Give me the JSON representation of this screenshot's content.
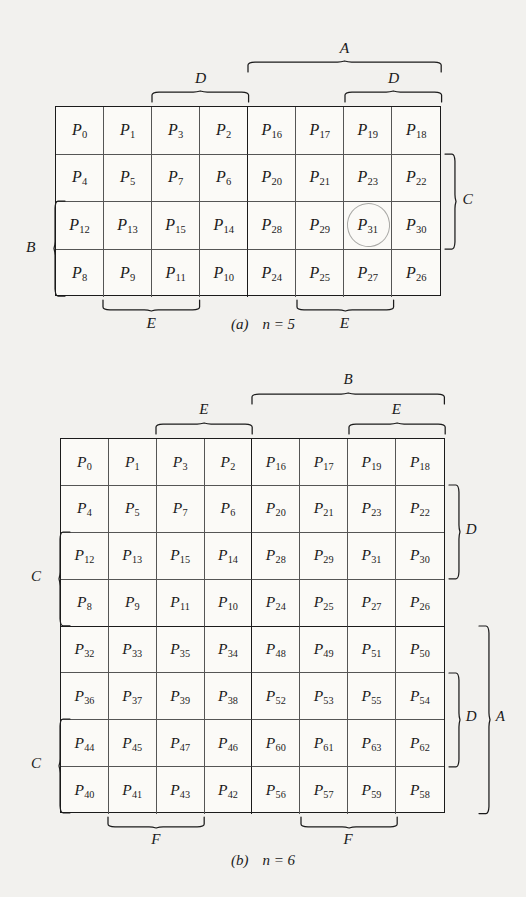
{
  "page": {
    "background_color": "#f2f1ee",
    "ink_color": "#1b1b1b",
    "pencil_color": "#9a9a96"
  },
  "figures": [
    {
      "id": "figure-a",
      "caption_label": "(a)",
      "caption_text": "n = 5",
      "rows": 4,
      "cols": 8,
      "cells": [
        [
          "P0",
          "P1",
          "P3",
          "P2",
          "P16",
          "P17",
          "P19",
          "P18"
        ],
        [
          "P4",
          "P5",
          "P7",
          "P6",
          "P20",
          "P21",
          "P23",
          "P22"
        ],
        [
          "P12",
          "P13",
          "P15",
          "P14",
          "P28",
          "P29",
          "P31",
          "P30"
        ],
        [
          "P8",
          "P9",
          "P11",
          "P10",
          "P24",
          "P25",
          "P27",
          "P26"
        ]
      ],
      "cell_subscripts": [
        [
          "0",
          "1",
          "3",
          "2",
          "16",
          "17",
          "19",
          "18"
        ],
        [
          "4",
          "5",
          "7",
          "6",
          "20",
          "21",
          "23",
          "22"
        ],
        [
          "12",
          "13",
          "15",
          "14",
          "28",
          "29",
          "31",
          "30"
        ],
        [
          "8",
          "9",
          "11",
          "10",
          "24",
          "25",
          "27",
          "26"
        ]
      ],
      "cell_base": "P",
      "circled_cell": {
        "row": 2,
        "col": 6,
        "label": "P31"
      },
      "braces": [
        {
          "label": "A",
          "side": "top",
          "from_col": 4,
          "to_col": 7,
          "level": 2
        },
        {
          "label": "D",
          "side": "top",
          "from_col": 2,
          "to_col": 3,
          "level": 1
        },
        {
          "label": "D",
          "side": "top",
          "from_col": 6,
          "to_col": 7,
          "level": 1
        },
        {
          "label": "E",
          "side": "bottom",
          "from_col": 1,
          "to_col": 2,
          "level": 1
        },
        {
          "label": "E",
          "side": "bottom",
          "from_col": 5,
          "to_col": 6,
          "level": 1
        },
        {
          "label": "B",
          "side": "left",
          "from_row": 2,
          "to_row": 3,
          "level": 1
        },
        {
          "label": "C",
          "side": "right",
          "from_row": 1,
          "to_row": 2,
          "level": 1
        }
      ]
    },
    {
      "id": "figure-b",
      "caption_label": "(b)",
      "caption_text": "n = 6",
      "rows": 8,
      "cols": 8,
      "cells": [
        [
          "P0",
          "P1",
          "P3",
          "P2",
          "P16",
          "P17",
          "P19",
          "P18"
        ],
        [
          "P4",
          "P5",
          "P7",
          "P6",
          "P20",
          "P21",
          "P23",
          "P22"
        ],
        [
          "P12",
          "P13",
          "P15",
          "P14",
          "P28",
          "P29",
          "P31",
          "P30"
        ],
        [
          "P8",
          "P9",
          "P11",
          "P10",
          "P24",
          "P25",
          "P27",
          "P26"
        ],
        [
          "P32",
          "P33",
          "P35",
          "P34",
          "P48",
          "P49",
          "P51",
          "P50"
        ],
        [
          "P36",
          "P37",
          "P39",
          "P38",
          "P52",
          "P53",
          "P55",
          "P54"
        ],
        [
          "P44",
          "P45",
          "P47",
          "P46",
          "P60",
          "P61",
          "P63",
          "P62"
        ],
        [
          "P40",
          "P41",
          "P43",
          "P42",
          "P56",
          "P57",
          "P59",
          "P58"
        ]
      ],
      "cell_subscripts": [
        [
          "0",
          "1",
          "3",
          "2",
          "16",
          "17",
          "19",
          "18"
        ],
        [
          "4",
          "5",
          "7",
          "6",
          "20",
          "21",
          "23",
          "22"
        ],
        [
          "12",
          "13",
          "15",
          "14",
          "28",
          "29",
          "31",
          "30"
        ],
        [
          "8",
          "9",
          "11",
          "10",
          "24",
          "25",
          "27",
          "26"
        ],
        [
          "32",
          "33",
          "35",
          "34",
          "48",
          "49",
          "51",
          "50"
        ],
        [
          "36",
          "37",
          "39",
          "38",
          "52",
          "53",
          "55",
          "54"
        ],
        [
          "44",
          "45",
          "47",
          "46",
          "60",
          "61",
          "63",
          "62"
        ],
        [
          "40",
          "41",
          "43",
          "42",
          "56",
          "57",
          "59",
          "58"
        ]
      ],
      "cell_base": "P",
      "circled_cell": null,
      "braces": [
        {
          "label": "B",
          "side": "top",
          "from_col": 4,
          "to_col": 7,
          "level": 2
        },
        {
          "label": "E",
          "side": "top",
          "from_col": 2,
          "to_col": 3,
          "level": 1
        },
        {
          "label": "E",
          "side": "top",
          "from_col": 6,
          "to_col": 7,
          "level": 1
        },
        {
          "label": "F",
          "side": "bottom",
          "from_col": 1,
          "to_col": 2,
          "level": 1
        },
        {
          "label": "F",
          "side": "bottom",
          "from_col": 5,
          "to_col": 6,
          "level": 1
        },
        {
          "label": "C",
          "side": "left",
          "from_row": 2,
          "to_row": 3,
          "level": 1
        },
        {
          "label": "C",
          "side": "left",
          "from_row": 6,
          "to_row": 7,
          "level": 1
        },
        {
          "label": "D",
          "side": "right",
          "from_row": 1,
          "to_row": 2,
          "level": 1
        },
        {
          "label": "D",
          "side": "right",
          "from_row": 5,
          "to_row": 6,
          "level": 1
        },
        {
          "label": "A",
          "side": "right",
          "from_row": 4,
          "to_row": 7,
          "level": 2
        }
      ]
    }
  ]
}
